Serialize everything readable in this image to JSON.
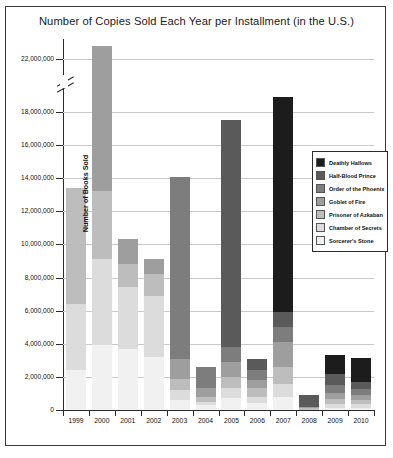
{
  "chart_data": {
    "type": "bar",
    "title": "Number of Copies Sold Each Year per Installment (in the U.S.)",
    "xlabel": "Year",
    "ylabel": "Number of Books Sold",
    "grid": true,
    "legend_position": "inside-right",
    "axis_break": {
      "between": [
        18000000,
        22000000
      ],
      "note": "y-axis broken, 20,000,000 omitted"
    },
    "ylim": [
      0,
      23500000
    ],
    "ytick_labels": [
      "0",
      "2,000,000",
      "4,000,000",
      "6,000,000",
      "8,000,000",
      "10,000,000",
      "12,000,000",
      "14,000,000",
      "16,000,000",
      "18,000,000",
      "22,000,000"
    ],
    "ytick_values": [
      0,
      2000000,
      4000000,
      6000000,
      8000000,
      10000000,
      12000000,
      14000000,
      16000000,
      18000000,
      22000000
    ],
    "categories": [
      "1999",
      "2000",
      "2001",
      "2002",
      "2003",
      "2004",
      "2005",
      "2006",
      "2007",
      "2008",
      "2009",
      "2010"
    ],
    "series": [
      {
        "name": "Deathly Hallows",
        "color": "#1c1c1c",
        "values": [
          0,
          0,
          0,
          0,
          0,
          0,
          0,
          0,
          13200000,
          0,
          1100000,
          1450000
        ]
      },
      {
        "name": "Half-Blood Prince",
        "color": "#5a5a5a",
        "values": [
          0,
          0,
          0,
          0,
          0,
          0,
          13700000,
          700000,
          900000,
          700000,
          700000,
          450000
        ]
      },
      {
        "name": "Order of the Phoenix",
        "color": "#7d7d7d",
        "values": [
          0,
          0,
          0,
          0,
          11000000,
          1300000,
          900000,
          600000,
          900000,
          0,
          450000,
          350000
        ]
      },
      {
        "name": "Goblet of Fire",
        "color": "#9e9e9e",
        "values": [
          0,
          9800000,
          1500000,
          900000,
          1200000,
          500000,
          900000,
          500000,
          1500000,
          100000,
          400000,
          300000
        ]
      },
      {
        "name": "Prisoner of Azkaban",
        "color": "#bdbdbd",
        "values": [
          7000000,
          4100000,
          1400000,
          1300000,
          700000,
          300000,
          700000,
          500000,
          1000000,
          100000,
          300000,
          250000
        ]
      },
      {
        "name": "Chamber of Secrets",
        "color": "#dcdcdc",
        "values": [
          4000000,
          5200000,
          3700000,
          3700000,
          600000,
          200000,
          600000,
          400000,
          800000,
          0,
          200000,
          200000
        ]
      },
      {
        "name": "Sorcerer's Stone",
        "color": "#f1f1f1",
        "values": [
          2400000,
          3900000,
          3700000,
          3200000,
          600000,
          300000,
          700000,
          400000,
          800000,
          0,
          150000,
          150000
        ]
      }
    ],
    "totals": [
      13400000,
      23000000,
      10300000,
      9600000,
      14100000,
      2600000,
      17500000,
      3100000,
      19100000,
      900000,
      3300000,
      3150000
    ]
  }
}
